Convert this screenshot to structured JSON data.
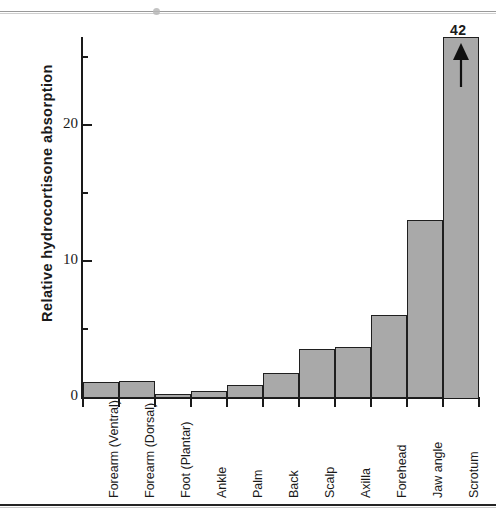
{
  "chart_data": {
    "type": "bar",
    "title": "",
    "subtitle": "",
    "xlabel": "",
    "ylabel": "Relative  hydrocortisone  absorption",
    "ylim": [
      0,
      26
    ],
    "grid": false,
    "legend": null,
    "categories": [
      "Forearm (Ventral)",
      "Forearm (Dorsal)",
      "Foot (Plantar)",
      "Ankle",
      "Palm",
      "Back",
      "Scalp",
      "Axilla",
      "Forehead",
      "Jaw angle",
      "Scrotum"
    ],
    "values": [
      1.1,
      1.2,
      0.2,
      0.45,
      0.85,
      1.8,
      3.5,
      3.7,
      6.0,
      13.0,
      42
    ],
    "y_major_ticks": [
      0,
      10,
      20
    ],
    "y_major_tick_labels": [
      "0",
      "10",
      "20"
    ],
    "y_minor_ticks": [
      5,
      15,
      25
    ],
    "annotations": [
      {
        "category": "Scrotum",
        "value_label": "42",
        "marker": "up-arrow",
        "note": "bar exceeds axis range"
      }
    ],
    "bar_fill_color": "#a9a9a9",
    "bar_edge_color": "#1f1f1f",
    "axis_color": "#1a1a1a"
  },
  "figure": {
    "y_axis_title": "Relative  hydrocortisone  absorption"
  }
}
